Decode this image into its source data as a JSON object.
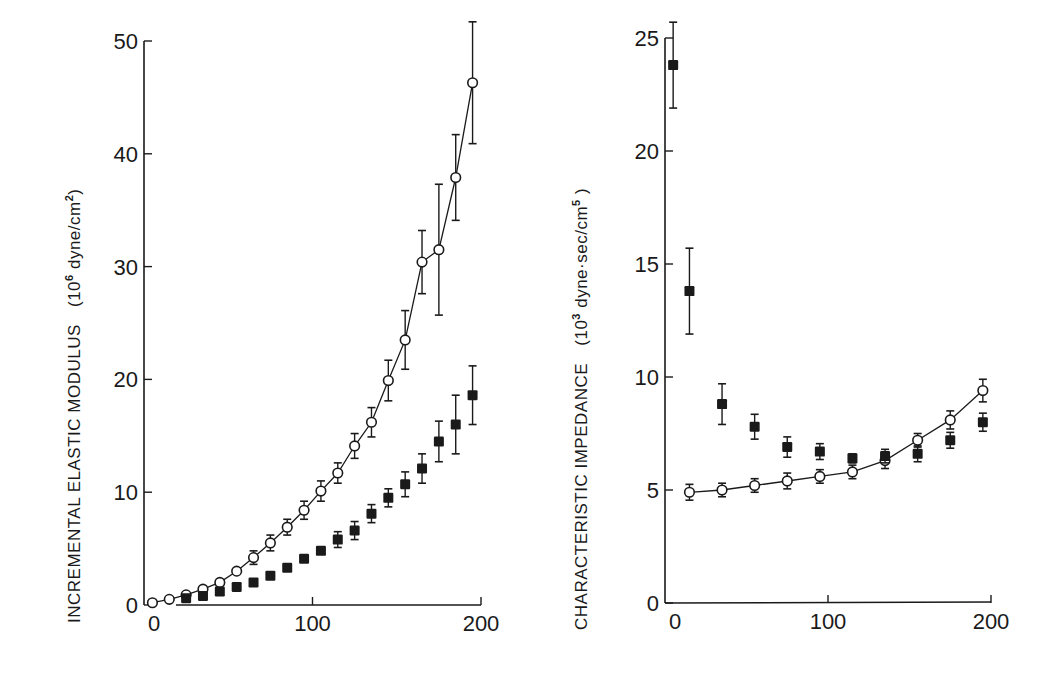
{
  "chart_data": [
    {
      "type": "scatter",
      "panel": "left",
      "title": "",
      "xlabel": "",
      "ylabel": "INCREMENTAL ELASTIC MODULUS (10⁶ dyne/cm²)",
      "ylabel_main": "INCREMENTAL  ELASTIC  MODULUS",
      "ylabel_units": "(10⁶ dyne/cm²)",
      "xlim": [
        0,
        200
      ],
      "ylim": [
        0,
        50
      ],
      "xticks": [
        0,
        100,
        200
      ],
      "yticks": [
        0,
        10,
        20,
        30,
        40,
        50
      ],
      "grid": false,
      "legend": "none",
      "series": [
        {
          "name": "open circles",
          "marker": "open-circle",
          "connected": true,
          "x": [
            5,
            15,
            25,
            35,
            45,
            55,
            65,
            75,
            85,
            95,
            105,
            115,
            125,
            135,
            145,
            155,
            165,
            175,
            185,
            195
          ],
          "y": [
            0.2,
            0.5,
            0.9,
            1.4,
            2.0,
            3.0,
            4.2,
            5.5,
            6.9,
            8.4,
            10.1,
            11.7,
            14.1,
            16.2,
            19.9,
            23.5,
            30.4,
            31.5,
            37.9,
            46.3
          ],
          "err": [
            0,
            0,
            0,
            0,
            0,
            0,
            0.6,
            0.7,
            0.7,
            0.8,
            0.9,
            0.9,
            1.1,
            1.3,
            1.8,
            2.6,
            2.8,
            5.8,
            3.8,
            5.4
          ]
        },
        {
          "name": "filled squares",
          "marker": "filled-square",
          "connected": false,
          "x": [
            25,
            35,
            45,
            55,
            65,
            75,
            85,
            95,
            105,
            115,
            125,
            135,
            145,
            155,
            165,
            175,
            185,
            195
          ],
          "y": [
            0.6,
            0.8,
            1.2,
            1.6,
            2.0,
            2.6,
            3.3,
            4.1,
            4.8,
            5.8,
            6.6,
            8.1,
            9.5,
            10.7,
            12.1,
            14.5,
            16.0,
            18.6
          ],
          "err": [
            0,
            0,
            0,
            0,
            0,
            0,
            0,
            0,
            0,
            0.7,
            0.8,
            0.8,
            0.8,
            1.1,
            1.3,
            1.8,
            2.6,
            2.6
          ]
        }
      ]
    },
    {
      "type": "scatter",
      "panel": "right",
      "title": "",
      "xlabel": "",
      "ylabel": "CHARACTERISTIC IMPEDANCE (10³ dyne·sec/cm⁵)",
      "ylabel_main": "CHARACTERISTIC  IMPEDANCE",
      "ylabel_units": "(10³ dyne·sec/cm⁵)",
      "xlim": [
        0,
        200
      ],
      "ylim": [
        0,
        25
      ],
      "xticks": [
        0,
        100,
        200
      ],
      "yticks": [
        0,
        5,
        10,
        15,
        20,
        25
      ],
      "grid": false,
      "legend": "none",
      "series": [
        {
          "name": "open circles",
          "marker": "open-circle",
          "connected": true,
          "x": [
            15,
            35,
            55,
            75,
            95,
            115,
            135,
            155,
            175,
            195
          ],
          "y": [
            4.9,
            5.0,
            5.2,
            5.4,
            5.6,
            5.8,
            6.3,
            7.2,
            8.1,
            9.4
          ],
          "err": [
            0.35,
            0.3,
            0.3,
            0.35,
            0.3,
            0.3,
            0.35,
            0.3,
            0.4,
            0.5
          ]
        },
        {
          "name": "filled squares",
          "marker": "filled-square",
          "connected": false,
          "x": [
            5,
            15,
            35,
            55,
            75,
            95,
            115,
            135,
            155,
            175,
            195
          ],
          "y": [
            23.8,
            13.8,
            8.8,
            7.8,
            6.9,
            6.7,
            6.4,
            6.5,
            6.6,
            7.2,
            8.0
          ],
          "err": [
            1.9,
            1.9,
            0.9,
            0.55,
            0.45,
            0.35,
            0.2,
            0.3,
            0.35,
            0.35,
            0.4
          ]
        }
      ]
    }
  ],
  "panels": {
    "left": {
      "ylabel_main": "INCREMENTAL  ELASTIC  MODULUS",
      "ylabel_units_prefix": "(10",
      "ylabel_units_exp": "6",
      "ylabel_units_mid": " dyne/cm",
      "ylabel_units_exp2": "2",
      "ylabel_units_suffix": ")",
      "yticks": [
        "0",
        "10",
        "20",
        "30",
        "40",
        "50"
      ],
      "xticks": [
        "0",
        "100",
        "200"
      ]
    },
    "right": {
      "ylabel_main": "CHARACTERISTIC  IMPEDANCE",
      "ylabel_units_prefix": "(10",
      "ylabel_units_exp": "3",
      "ylabel_units_mid": " dyne·sec/cm",
      "ylabel_units_exp2": "5",
      "ylabel_units_suffix": " )",
      "yticks": [
        "0",
        "5",
        "10",
        "15",
        "20",
        "25"
      ],
      "xticks": [
        "0",
        "100",
        "200"
      ]
    }
  },
  "colors": {
    "ink": "#1a1a1a",
    "background": "#ffffff"
  }
}
